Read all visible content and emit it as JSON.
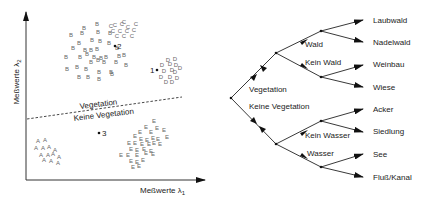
{
  "scatter": {
    "x_axis_label": "Meßwerte λ",
    "x_axis_sub": "1",
    "y_axis_label": "Meßwerte λ",
    "y_axis_sub": "2",
    "boundary_upper_label": "Vegetation",
    "boundary_lower_label": "Keine Vegetation",
    "markers": [
      {
        "label": "1",
        "x": 157,
        "y": 70
      },
      {
        "label": "2",
        "x": 115,
        "y": 46
      },
      {
        "label": "3",
        "x": 99,
        "y": 133
      }
    ],
    "clusters": {
      "A": {
        "label": "A",
        "points": [
          [
            38,
            143
          ],
          [
            45,
            142
          ],
          [
            36,
            150
          ],
          [
            43,
            150
          ],
          [
            49,
            149
          ],
          [
            55,
            152
          ],
          [
            41,
            157
          ],
          [
            48,
            157
          ],
          [
            53,
            156
          ],
          [
            59,
            159
          ],
          [
            44,
            162
          ],
          [
            51,
            163
          ],
          [
            58,
            165
          ]
        ]
      },
      "B": {
        "label": "B",
        "points": [
          [
            97,
            26
          ],
          [
            84,
            30
          ],
          [
            71,
            37
          ],
          [
            82,
            35
          ],
          [
            98,
            34
          ],
          [
            110,
            35
          ],
          [
            79,
            45
          ],
          [
            92,
            42
          ],
          [
            100,
            43
          ],
          [
            109,
            45
          ],
          [
            73,
            50
          ],
          [
            85,
            52
          ],
          [
            91,
            52
          ],
          [
            97,
            51
          ],
          [
            117,
            50
          ],
          [
            66,
            59
          ],
          [
            80,
            59
          ],
          [
            87,
            56
          ],
          [
            94,
            59
          ],
          [
            101,
            60
          ],
          [
            106,
            59
          ],
          [
            119,
            58
          ],
          [
            124,
            57
          ],
          [
            91,
            64
          ],
          [
            98,
            62
          ],
          [
            104,
            64
          ],
          [
            116,
            64
          ],
          [
            126,
            67
          ],
          [
            67,
            71
          ],
          [
            77,
            69
          ],
          [
            86,
            71
          ],
          [
            99,
            74
          ],
          [
            111,
            74
          ],
          [
            79,
            79
          ],
          [
            88,
            79
          ],
          [
            99,
            81
          ],
          [
            112,
            76
          ]
        ]
      },
      "C": {
        "label": "C",
        "points": [
          [
            124,
            24
          ],
          [
            115,
            27
          ],
          [
            122,
            26
          ],
          [
            111,
            28
          ],
          [
            128,
            29
          ],
          [
            136,
            26
          ],
          [
            113,
            33
          ],
          [
            120,
            33
          ],
          [
            127,
            33
          ],
          [
            134,
            32
          ],
          [
            117,
            38
          ],
          [
            124,
            38
          ],
          [
            132,
            38
          ]
        ]
      },
      "D": {
        "label": "D",
        "points": [
          [
            168,
            62
          ],
          [
            175,
            61
          ],
          [
            162,
            67
          ],
          [
            170,
            66
          ],
          [
            176,
            67
          ],
          [
            180,
            70
          ],
          [
            164,
            73
          ],
          [
            172,
            72
          ],
          [
            175,
            74
          ],
          [
            161,
            79
          ],
          [
            170,
            79
          ],
          [
            177,
            80
          ],
          [
            166,
            84
          ],
          [
            172,
            84
          ]
        ]
      },
      "E": {
        "label": "E",
        "points": [
          [
            154,
            123
          ],
          [
            146,
            129
          ],
          [
            157,
            130
          ],
          [
            140,
            134
          ],
          [
            151,
            134
          ],
          [
            164,
            132
          ],
          [
            135,
            138
          ],
          [
            141,
            141
          ],
          [
            147,
            142
          ],
          [
            153,
            140
          ],
          [
            158,
            141
          ],
          [
            167,
            139
          ],
          [
            129,
            145
          ],
          [
            135,
            145
          ],
          [
            142,
            146
          ],
          [
            149,
            146
          ],
          [
            154,
            145
          ],
          [
            160,
            146
          ],
          [
            131,
            151
          ],
          [
            137,
            152
          ],
          [
            144,
            151
          ],
          [
            151,
            153
          ],
          [
            121,
            157
          ],
          [
            128,
            157
          ],
          [
            137,
            157
          ],
          [
            146,
            155
          ],
          [
            153,
            156
          ],
          [
            131,
            163
          ],
          [
            137,
            164
          ],
          [
            143,
            162
          ],
          [
            133,
            169
          ],
          [
            139,
            168
          ]
        ]
      }
    }
  },
  "tree": {
    "root_branches": [
      {
        "label": "Vegetation"
      },
      {
        "label": "Keine Vegetation"
      }
    ],
    "mid_branches": [
      {
        "label": "Wald"
      },
      {
        "label": "Kein Wald"
      },
      {
        "label": "Kein Wasser"
      },
      {
        "label": "Wasser"
      }
    ],
    "leaves": [
      {
        "label": "Laubwald"
      },
      {
        "label": "Nadelwald"
      },
      {
        "label": "Weinbau"
      },
      {
        "label": "Wiese"
      },
      {
        "label": "Acker"
      },
      {
        "label": "Siedlung"
      },
      {
        "label": "See"
      },
      {
        "label": "Fluß/Kanal"
      }
    ]
  }
}
